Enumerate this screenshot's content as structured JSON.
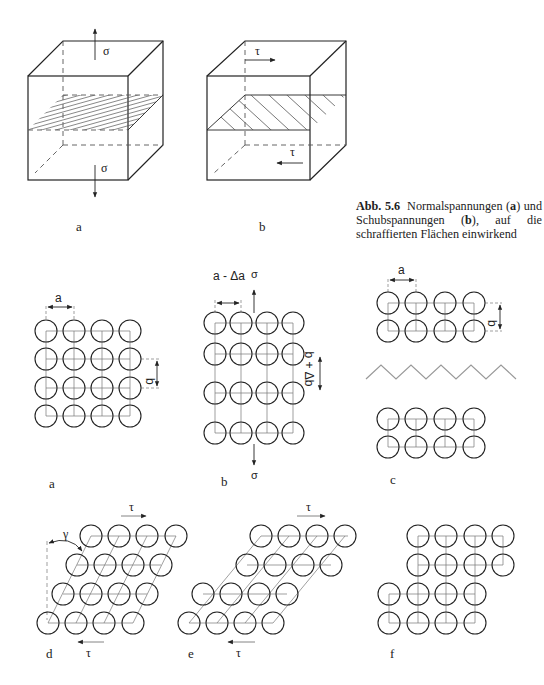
{
  "caption": {
    "label": "Abb. 5.6",
    "text_line1": "Normalspannungen (",
    "a": "a",
    "text_mid": ") und Schubspannungen (",
    "b": "b",
    "text_end": "), auf die schraffierten Flächen einwirkend"
  },
  "top_panels": [
    {
      "label": "a",
      "stress_symbol": "σ",
      "type": "normal-stress-cube"
    },
    {
      "label": "b",
      "stress_symbol": "τ",
      "type": "shear-stress-cube"
    }
  ],
  "middle_panels": [
    {
      "label": "a",
      "dims": [
        "a",
        "b"
      ],
      "rows": 4,
      "cols": 4
    },
    {
      "label": "b",
      "dims": [
        "a - Δa",
        "b + Δb"
      ],
      "stress_symbol": "σ",
      "rows": 4,
      "cols": 4
    },
    {
      "label": "c",
      "dims": [
        "a",
        "b"
      ],
      "rows": 2,
      "cols": 4,
      "separated": true
    }
  ],
  "bottom_panels": [
    {
      "label": "d",
      "stress_symbol": "τ",
      "angle_symbol": "γ"
    },
    {
      "label": "e",
      "stress_symbol": "τ"
    },
    {
      "label": "f"
    }
  ],
  "colors": {
    "line": "#222222",
    "grid": "#777777",
    "text": "#222222"
  }
}
